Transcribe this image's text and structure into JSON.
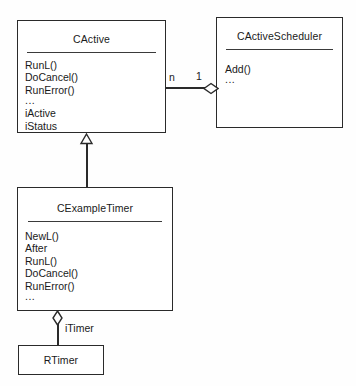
{
  "diagram": {
    "type": "uml-class-diagram",
    "classes": [
      {
        "id": "cactive",
        "name": "CActive",
        "members": [
          "RunL()",
          "DoCancel()",
          "RunError()",
          "...",
          "iActive",
          "iStatus"
        ]
      },
      {
        "id": "cactivescheduler",
        "name": "CActiveScheduler",
        "members": [
          "Add()",
          "..."
        ]
      },
      {
        "id": "cexampletimer",
        "name": "CExampleTimer",
        "members": [
          "NewL()",
          "After",
          "RunL()",
          "DoCancel()",
          "RunError()",
          "..."
        ]
      },
      {
        "id": "rtimer",
        "name": "RTimer",
        "members": []
      }
    ],
    "relationships": [
      {
        "id": "cactive-cactivescheduler",
        "kind": "aggregation",
        "from": "CActive",
        "to": "CActiveScheduler",
        "source_multiplicity": "n",
        "target_multiplicity": "1"
      },
      {
        "id": "cexampletimer-cactive",
        "kind": "generalization",
        "from": "CExampleTimer",
        "to": "CActive"
      },
      {
        "id": "cexampletimer-rtimer",
        "kind": "aggregation",
        "from": "CExampleTimer",
        "to": "RTimer",
        "role": "iTimer"
      }
    ],
    "colors": {
      "line": "#2a2a2a",
      "background": "#fefefe",
      "box_fill": "#ffffff",
      "text": "#1a1a1a"
    }
  }
}
